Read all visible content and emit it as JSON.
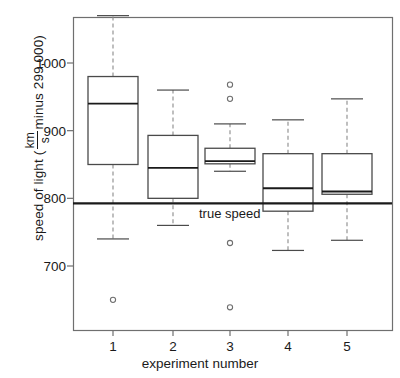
{
  "chart_data": {
    "type": "boxplot",
    "title": "",
    "xlabel": "experiment number",
    "ylabel_prefix": "speed of light (",
    "ylabel_numerator": "km",
    "ylabel_denominator": "s",
    "ylabel_suffix": " minus 299,000)",
    "categories": [
      "1",
      "2",
      "3",
      "4",
      "5"
    ],
    "xtick_labels": [
      "1",
      "2",
      "3",
      "4",
      "5"
    ],
    "ytick_labels": [
      "1000",
      "900",
      "800",
      "700"
    ],
    "ytick_values": [
      1000,
      900,
      800,
      700
    ],
    "ylim": [
      620,
      1080
    ],
    "xlim": [
      0.5,
      5.5
    ],
    "grid": false,
    "legend": "none",
    "annotation": {
      "text": "true speed",
      "value": 792.5,
      "style": "horizontal reference line"
    },
    "boxes": [
      {
        "category": "1",
        "whisker_low": 740,
        "q1": 850,
        "median": 940,
        "q3": 980,
        "whisker_high": 1070,
        "outliers": [
          650
        ]
      },
      {
        "category": "2",
        "whisker_low": 760,
        "q1": 800,
        "median": 845,
        "q3": 893,
        "whisker_high": 960,
        "outliers": []
      },
      {
        "category": "3",
        "whisker_low": 840,
        "q1": 851,
        "median": 855,
        "q3": 874,
        "whisker_high": 910,
        "outliers": [
          968,
          947,
          734,
          639
        ]
      },
      {
        "category": "4",
        "whisker_low": 723,
        "q1": 781,
        "median": 815,
        "q3": 866,
        "whisker_high": 916,
        "outliers": []
      },
      {
        "category": "5",
        "whisker_low": 738,
        "q1": 806,
        "median": 810,
        "q3": 866,
        "whisker_high": 947,
        "outliers": []
      }
    ],
    "colors": {
      "box_line": "#4a4a4a",
      "median_line": "#1a1a1a",
      "whisker_line": "#8a8a8a",
      "reference_line": "#1a1a1a",
      "axis": "#6f6f6f",
      "background": "#ffffff"
    }
  }
}
